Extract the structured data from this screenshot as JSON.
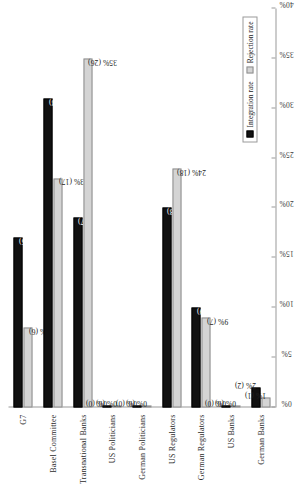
{
  "chart_data": {
    "type": "bar",
    "orientation": "horizontal",
    "title": "",
    "xlabel": "",
    "ylabel": "",
    "categories": [
      "G7",
      "Basel Committee",
      "Transnational Banks",
      "US Politicians",
      "German Politicians",
      "US Regulators",
      "German Regulators",
      "US Banks",
      "German Banks"
    ],
    "series": [
      {
        "name": "Integration rate",
        "color": "#111111",
        "values": [
          17,
          31,
          19,
          0,
          0,
          20,
          10,
          0,
          2
        ],
        "counts": [
          15,
          28,
          17,
          0,
          0,
          18,
          9,
          0,
          2
        ],
        "labels": [
          "17% (15)",
          "31% (28)",
          "19% (17)",
          "0% (0)",
          "0% (0)",
          "20% (18)",
          "10% (9)",
          "0% (0)",
          "2% (2)"
        ]
      },
      {
        "name": "Rejection rate",
        "color": "#d4d4d4",
        "values": [
          8,
          23,
          35,
          0,
          0,
          24,
          9,
          0,
          1
        ],
        "counts": [
          6,
          17,
          26,
          0,
          0,
          18,
          7,
          0,
          1
        ],
        "labels": [
          "8% (6)",
          "23% (17)",
          "35% (26)",
          "0% (0)",
          "0% (0)",
          "24% (18)",
          "9% (7)",
          "0% (0)",
          "1% (1)"
        ]
      }
    ],
    "xlim": [
      0,
      40
    ],
    "xticks": [
      0,
      5,
      10,
      15,
      20,
      25,
      30,
      35,
      40
    ],
    "xticklabels": [
      "0%",
      "5%",
      "10%",
      "15%",
      "20%",
      "25%",
      "30%",
      "35%",
      "40%"
    ],
    "grid": false,
    "legend_position": "bottom-right",
    "legend_entries": [
      "Integration rate",
      "Rejection rate"
    ]
  }
}
